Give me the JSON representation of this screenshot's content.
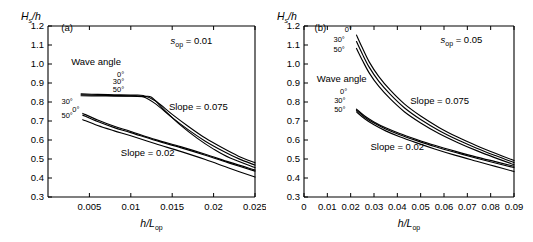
{
  "figure": {
    "background": "#ffffff",
    "line_color": "#000000",
    "panel_count": 2
  },
  "chart_data": [
    {
      "type": "line",
      "panel_label": "(a)",
      "title": "",
      "xlabel": "h/Lop",
      "ylabel": "Hs/h",
      "xlim": [
        0,
        0.025
      ],
      "ylim": [
        0.3,
        1.2
      ],
      "xticks": [
        0.005,
        0.01,
        0.015,
        0.02,
        0.025
      ],
      "xticklabels": [
        "0.005",
        "0.01",
        "0.015",
        "0.02",
        "0.025"
      ],
      "yticks": [
        0.3,
        0.4,
        0.5,
        0.6,
        0.7,
        0.8,
        0.9,
        1.0,
        1.1,
        1.2
      ],
      "yticklabels": [
        "0.3",
        "0.4",
        "0.5",
        "0.6",
        "0.7",
        "0.8",
        "0.9",
        "1.0",
        "1.1",
        "1.2"
      ],
      "grid": false,
      "legend": "inline-annotations",
      "annotations": [
        {
          "name": "sop-value",
          "text": "sop = 0.01",
          "base": "s",
          "sub": "op",
          "value": "= 0.01"
        },
        {
          "name": "wave-angle-label",
          "text": "Wave angle"
        },
        {
          "name": "slope-0075-label",
          "text": "Slope = 0.075"
        },
        {
          "name": "slope-002-label",
          "text": "Slope = 0.02"
        }
      ],
      "angle_labels_upper": [
        "0°",
        "30°",
        "50°"
      ],
      "angle_labels_lower": [
        "30°",
        "0°",
        "50°"
      ],
      "series": [
        {
          "name": "slope 0.075, 0 deg",
          "group": "Slope = 0.075",
          "angle": "0°",
          "x": [
            0.004,
            0.006,
            0.008,
            0.01,
            0.0115,
            0.013,
            0.015,
            0.017,
            0.019,
            0.021,
            0.023,
            0.025
          ],
          "y": [
            0.843,
            0.84,
            0.838,
            0.836,
            0.834,
            0.805,
            0.735,
            0.67,
            0.61,
            0.56,
            0.515,
            0.48
          ]
        },
        {
          "name": "slope 0.075, 30 deg",
          "group": "Slope = 0.075",
          "angle": "30°",
          "x": [
            0.004,
            0.006,
            0.008,
            0.01,
            0.0115,
            0.013,
            0.015,
            0.017,
            0.019,
            0.021,
            0.023,
            0.025
          ],
          "y": [
            0.838,
            0.836,
            0.834,
            0.832,
            0.828,
            0.79,
            0.718,
            0.652,
            0.594,
            0.545,
            0.502,
            0.468
          ]
        },
        {
          "name": "slope 0.075, 50 deg",
          "group": "Slope = 0.075",
          "angle": "50°",
          "x": [
            0.004,
            0.006,
            0.008,
            0.01,
            0.0115,
            0.0125,
            0.014,
            0.016,
            0.018,
            0.02,
            0.022,
            0.025
          ],
          "y": [
            0.833,
            0.832,
            0.831,
            0.83,
            0.828,
            0.825,
            0.76,
            0.678,
            0.61,
            0.552,
            0.505,
            0.455
          ]
        },
        {
          "name": "slope 0.02, 30 deg",
          "group": "Slope = 0.02",
          "angle": "30°",
          "x": [
            0.0042,
            0.006,
            0.008,
            0.01,
            0.013,
            0.016,
            0.019,
            0.022,
            0.025
          ],
          "y": [
            0.74,
            0.705,
            0.672,
            0.645,
            0.602,
            0.565,
            0.525,
            0.482,
            0.442
          ]
        },
        {
          "name": "slope 0.02, 0 deg",
          "group": "Slope = 0.02",
          "angle": "0°",
          "x": [
            0.0042,
            0.006,
            0.008,
            0.01,
            0.013,
            0.016,
            0.019,
            0.022,
            0.025
          ],
          "y": [
            0.731,
            0.697,
            0.665,
            0.639,
            0.597,
            0.56,
            0.52,
            0.477,
            0.436
          ]
        },
        {
          "name": "slope 0.02, 50 deg",
          "group": "Slope = 0.02",
          "angle": "50°",
          "x": [
            0.0042,
            0.006,
            0.008,
            0.01,
            0.013,
            0.016,
            0.019,
            0.022,
            0.025
          ],
          "y": [
            0.707,
            0.676,
            0.648,
            0.622,
            0.58,
            0.54,
            0.497,
            0.45,
            0.405
          ]
        }
      ]
    },
    {
      "type": "line",
      "panel_label": "(b)",
      "title": "",
      "xlabel": "h/Lop",
      "ylabel": "Hs/h",
      "xlim": [
        0,
        0.09
      ],
      "ylim": [
        0.3,
        1.2
      ],
      "xticks": [
        0,
        0.01,
        0.02,
        0.03,
        0.04,
        0.05,
        0.06,
        0.07,
        0.08,
        0.09
      ],
      "xticklabels": [
        "0",
        "0.01",
        "0.02",
        "0.03",
        "0.04",
        "0.05",
        "0.06",
        "0.07",
        "0.08",
        "0.09"
      ],
      "yticks": [
        0.3,
        0.4,
        0.5,
        0.6,
        0.7,
        0.8,
        0.9,
        1.0,
        1.1,
        1.2
      ],
      "yticklabels": [
        "0.3",
        "0.4",
        "0.5",
        "0.6",
        "0.7",
        "0.8",
        "0.9",
        "1.0",
        "1.1",
        "1.2"
      ],
      "grid": false,
      "legend": "inline-annotations",
      "annotations": [
        {
          "name": "sop-value",
          "text": "sop = 0.05",
          "base": "s",
          "sub": "op",
          "value": "= 0.05"
        },
        {
          "name": "wave-angle-label",
          "text": "Wave angle"
        },
        {
          "name": "slope-0075-label",
          "text": "Slope = 0.075"
        },
        {
          "name": "slope-002-label",
          "text": "Slope = 0.02"
        }
      ],
      "angle_labels_upper": [
        "0°",
        "30°",
        "50°"
      ],
      "angle_labels_lower": [
        "0°",
        "30°",
        "50°"
      ],
      "series": [
        {
          "name": "slope 0.075, 0 deg",
          "group": "Slope = 0.075",
          "angle": "0°",
          "x": [
            0.0225,
            0.025,
            0.028,
            0.032,
            0.037,
            0.043,
            0.05,
            0.058,
            0.066,
            0.074,
            0.082,
            0.09
          ],
          "y": [
            1.152,
            1.085,
            1.01,
            0.935,
            0.862,
            0.79,
            0.726,
            0.665,
            0.614,
            0.57,
            0.53,
            0.492
          ]
        },
        {
          "name": "slope 0.075, 30 deg",
          "group": "Slope = 0.075",
          "angle": "30°",
          "x": [
            0.0225,
            0.025,
            0.028,
            0.032,
            0.037,
            0.043,
            0.05,
            0.058,
            0.066,
            0.074,
            0.082,
            0.09
          ],
          "y": [
            1.118,
            1.053,
            0.982,
            0.91,
            0.84,
            0.77,
            0.708,
            0.649,
            0.6,
            0.557,
            0.518,
            0.481
          ]
        },
        {
          "name": "slope 0.075, 50 deg",
          "group": "Slope = 0.075",
          "angle": "50°",
          "x": [
            0.0225,
            0.025,
            0.028,
            0.032,
            0.037,
            0.043,
            0.05,
            0.058,
            0.066,
            0.074,
            0.082,
            0.09
          ],
          "y": [
            1.082,
            1.02,
            0.952,
            0.883,
            0.816,
            0.749,
            0.69,
            0.633,
            0.586,
            0.544,
            0.506,
            0.47
          ]
        },
        {
          "name": "slope 0.02, 0 deg",
          "group": "Slope = 0.02",
          "angle": "0°",
          "x": [
            0.0225,
            0.026,
            0.03,
            0.035,
            0.041,
            0.048,
            0.056,
            0.065,
            0.074,
            0.082,
            0.09
          ],
          "y": [
            0.762,
            0.726,
            0.695,
            0.664,
            0.634,
            0.604,
            0.572,
            0.54,
            0.51,
            0.486,
            0.462
          ]
        },
        {
          "name": "slope 0.02, 30 deg",
          "group": "Slope = 0.02",
          "angle": "30°",
          "x": [
            0.0225,
            0.026,
            0.03,
            0.035,
            0.041,
            0.048,
            0.056,
            0.065,
            0.074,
            0.082,
            0.09
          ],
          "y": [
            0.756,
            0.72,
            0.689,
            0.658,
            0.628,
            0.598,
            0.566,
            0.534,
            0.504,
            0.479,
            0.455
          ]
        },
        {
          "name": "slope 0.02, 50 deg",
          "group": "Slope = 0.02",
          "angle": "50°",
          "x": [
            0.0225,
            0.026,
            0.03,
            0.035,
            0.041,
            0.048,
            0.056,
            0.065,
            0.074,
            0.082,
            0.09
          ],
          "y": [
            0.748,
            0.712,
            0.68,
            0.648,
            0.617,
            0.586,
            0.553,
            0.519,
            0.488,
            0.461,
            0.434
          ]
        }
      ]
    }
  ]
}
